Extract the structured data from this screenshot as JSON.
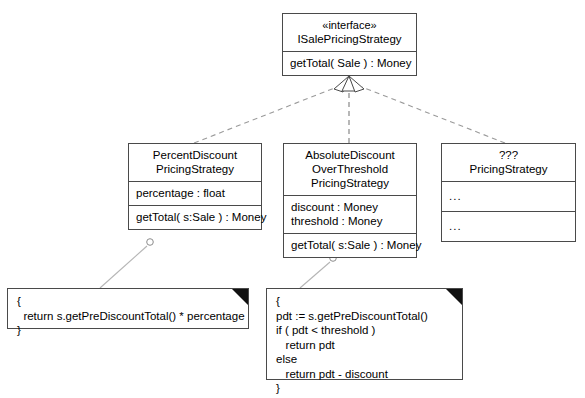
{
  "diagram": {
    "stroke_color": "#4a4a4a",
    "dashed_color": "#9a9a9a",
    "fold_color": "#111111"
  },
  "interface_class": {
    "stereotype": "«interface»",
    "name": "ISalePricingStrategy",
    "operations": [
      "getTotal( Sale ) : Money"
    ]
  },
  "subclasses": [
    {
      "name_lines": [
        "PercentDiscount",
        "PricingStrategy"
      ],
      "attributes": [
        "percentage : float"
      ],
      "operations": [
        "getTotal( s:Sale ) : Money"
      ]
    },
    {
      "name_lines": [
        "AbsoluteDiscount",
        "OverThreshold",
        "PricingStrategy"
      ],
      "attributes": [
        "discount : Money",
        "threshold : Money"
      ],
      "operations": [
        "getTotal( s:Sale ) : Money"
      ]
    },
    {
      "name_lines": [
        "???",
        "PricingStrategy"
      ],
      "attributes": [
        "..."
      ],
      "operations": [
        "..."
      ]
    }
  ],
  "notes": [
    {
      "lines": [
        "{",
        "  return s.getPreDiscountTotal() * percentage",
        "}"
      ]
    },
    {
      "lines": [
        "{",
        "pdt := s.getPreDiscountTotal()",
        "if ( pdt < threshold )",
        "   return pdt",
        "else",
        "   return pdt - discount",
        "}"
      ]
    }
  ]
}
